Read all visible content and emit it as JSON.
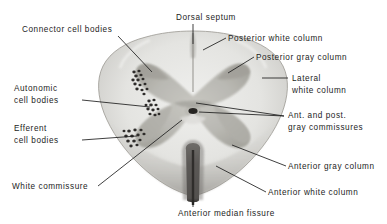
{
  "figure": {
    "background_color": "#ffffff",
    "ink_color": "#1d1d1d",
    "white_matter_color": "#e3e3e1",
    "gray_matter_color": "#b9b8b2",
    "cell_body_color": "#2e2c2a",
    "fissure_color": "#4a4846"
  },
  "labels": [
    {
      "id": "connector-cell-bodies",
      "text": "Connector cell bodies",
      "x": 22,
      "y": 24,
      "align": "left"
    },
    {
      "id": "dorsal-septum",
      "text": "Dorsal septum",
      "x": 176,
      "y": 12,
      "align": "left"
    },
    {
      "id": "posterior-white-column",
      "text": "Posterior white column",
      "x": 228,
      "y": 33,
      "align": "left"
    },
    {
      "id": "posterior-gray-column",
      "text": "Posterior gray column",
      "x": 256,
      "y": 52,
      "align": "left"
    },
    {
      "id": "lateral-white-column-line1",
      "text": "Lateral",
      "x": 292,
      "y": 73,
      "align": "left"
    },
    {
      "id": "lateral-white-column-line2",
      "text": "white column",
      "x": 292,
      "y": 85,
      "align": "left"
    },
    {
      "id": "autonomic-cell-bodies-line1",
      "text": "Autonomic",
      "x": 14,
      "y": 83,
      "align": "left"
    },
    {
      "id": "autonomic-cell-bodies-line2",
      "text": "cell bodies",
      "x": 14,
      "y": 95,
      "align": "left"
    },
    {
      "id": "ant-post-gray-commissures-line1",
      "text": "Ant. and post.",
      "x": 288,
      "y": 110,
      "align": "left"
    },
    {
      "id": "ant-post-gray-commissures-line2",
      "text": "gray commissures",
      "x": 288,
      "y": 122,
      "align": "left"
    },
    {
      "id": "efferent-cell-bodies-line1",
      "text": "Efferent",
      "x": 14,
      "y": 123,
      "align": "left"
    },
    {
      "id": "efferent-cell-bodies-line2",
      "text": "cell bodies",
      "x": 14,
      "y": 135,
      "align": "left"
    },
    {
      "id": "anterior-gray-column",
      "text": "Anterior gray column",
      "x": 288,
      "y": 161,
      "align": "left"
    },
    {
      "id": "white-commissure",
      "text": "White commissure",
      "x": 12,
      "y": 181,
      "align": "left"
    },
    {
      "id": "anterior-white-column",
      "text": "Anterior white column",
      "x": 268,
      "y": 187,
      "align": "left"
    },
    {
      "id": "anterior-median-fissure",
      "text": "Anterior median fissure",
      "x": 178,
      "y": 208,
      "align": "left"
    }
  ],
  "leader_lines": [
    {
      "id": "leader-connector-cell-bodies",
      "points": "118,36 152,72"
    },
    {
      "id": "leader-dorsal-septum",
      "points": "193,24 193,44"
    },
    {
      "id": "leader-posterior-white-column",
      "points": "226,38 203,50"
    },
    {
      "id": "leader-posterior-gray-column",
      "points": "254,57 228,73"
    },
    {
      "id": "leader-lateral-white-column",
      "points": "288,78 262,78"
    },
    {
      "id": "leader-autonomic-cell-bodies",
      "points": "82,100 150,107"
    },
    {
      "id": "leader-ant-post-gray-commissures",
      "points": "284,116 196,104"
    },
    {
      "id": "leader-efferent-cell-bodies",
      "points": "82,140 137,136"
    },
    {
      "id": "leader-central-canal",
      "points": "284,116 198,112"
    },
    {
      "id": "leader-anterior-gray-column",
      "points": "286,166 232,145"
    },
    {
      "id": "leader-white-commissure",
      "points": "98,186 182,120"
    },
    {
      "id": "leader-anterior-white-column",
      "points": "266,192 216,166"
    },
    {
      "id": "leader-anterior-median-fissure",
      "points": "193,200 193,207"
    }
  ],
  "structures": [
    {
      "id": "posterior-white-column",
      "name": "Posterior white column"
    },
    {
      "id": "posterior-gray-column",
      "name": "Posterior gray column"
    },
    {
      "id": "lateral-white-column",
      "name": "Lateral white column"
    },
    {
      "id": "anterior-gray-column",
      "name": "Anterior gray column"
    },
    {
      "id": "anterior-white-column",
      "name": "Anterior white column"
    },
    {
      "id": "central-canal",
      "name": "Central canal"
    },
    {
      "id": "anterior-median-fissure",
      "name": "Anterior median fissure"
    },
    {
      "id": "dorsal-septum",
      "name": "Dorsal septum"
    },
    {
      "id": "white-commissure",
      "name": "White commissure"
    },
    {
      "id": "gray-commissures",
      "name": "Ant. and post. gray commissures"
    }
  ],
  "cell_clusters": [
    {
      "id": "connector-cell-bodies",
      "name": "Connector cell bodies",
      "count": 14
    },
    {
      "id": "autonomic-cell-bodies",
      "name": "Autonomic cell bodies",
      "count": 11
    },
    {
      "id": "efferent-cell-bodies",
      "name": "Efferent cell bodies",
      "count": 13
    }
  ]
}
